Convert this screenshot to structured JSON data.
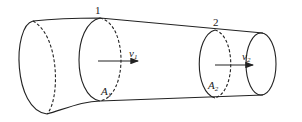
{
  "diagram": {
    "sections": [
      {
        "id": "section-1",
        "number": "1",
        "area_label": "A",
        "area_sub": "1",
        "velocity_label": "v",
        "velocity_sub": "1"
      },
      {
        "id": "section-2",
        "number": "2",
        "area_label": "A",
        "area_sub": "2",
        "velocity_label": "v",
        "velocity_sub": "2"
      }
    ],
    "colors": {
      "stroke": "#222222",
      "background": "#ffffff"
    }
  }
}
